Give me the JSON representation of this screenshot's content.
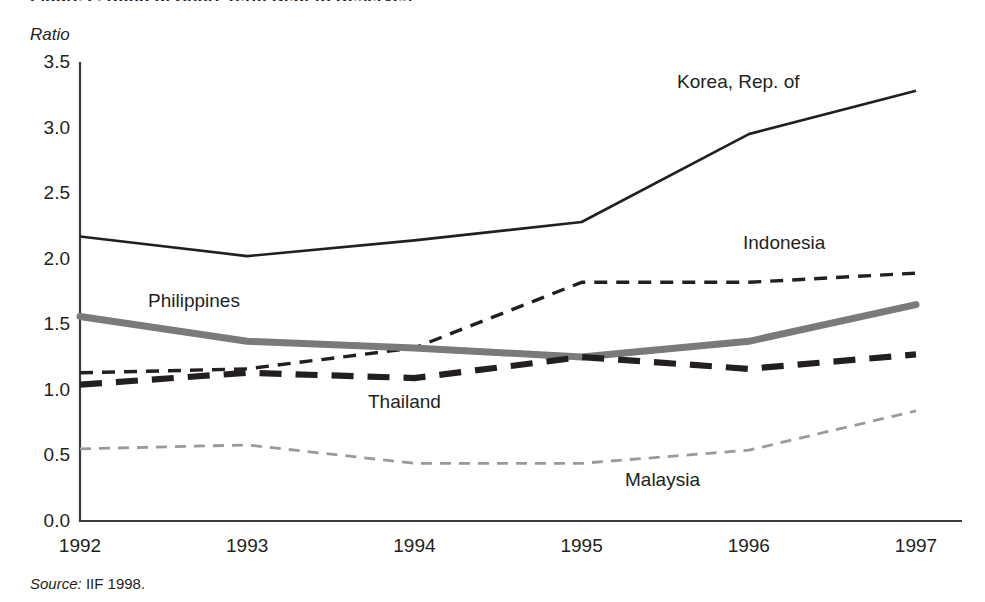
{
  "figure": {
    "title": "Figure 2. Ratio of Short-Term Debt to Reserves",
    "axis_unit_label": "Ratio",
    "source_prefix": "Source:",
    "source_text": "IIF 1998."
  },
  "chart_data": {
    "type": "line",
    "title": "Figure 2. Ratio of Short-Term Debt to Reserves",
    "xlabel": "",
    "ylabel": "Ratio",
    "x": [
      "1992",
      "1993",
      "1994",
      "1995",
      "1996",
      "1997"
    ],
    "xlim": [
      1992,
      1997
    ],
    "ylim": [
      0.0,
      3.5
    ],
    "yticks": [
      "0.0",
      "0.5",
      "1.0",
      "1.5",
      "2.0",
      "2.5",
      "3.0",
      "3.5"
    ],
    "ytick_values": [
      0.0,
      0.5,
      1.0,
      1.5,
      2.0,
      2.5,
      3.0,
      3.5
    ],
    "grid": false,
    "legend": "inline-labels",
    "series": [
      {
        "name": "Korea, Rep. of",
        "style": "solid-thin-black",
        "color": "#231f20",
        "values": [
          2.17,
          2.02,
          2.14,
          2.28,
          2.95,
          3.28
        ]
      },
      {
        "name": "Indonesia",
        "style": "dashed-medium-black",
        "color": "#231f20",
        "values": [
          1.13,
          1.16,
          1.32,
          1.82,
          1.82,
          1.89
        ]
      },
      {
        "name": "Philippines",
        "style": "solid-thick-gray",
        "color": "#7a7a7a",
        "values": [
          1.56,
          1.37,
          1.32,
          1.25,
          1.37,
          1.65
        ]
      },
      {
        "name": "Thailand",
        "style": "dashed-thick-black",
        "color": "#231f20",
        "values": [
          1.04,
          1.13,
          1.09,
          1.25,
          1.16,
          1.27
        ]
      },
      {
        "name": "Malaysia",
        "style": "dashed-thin-lightgray",
        "color": "#9a9a9a",
        "values": [
          0.55,
          0.58,
          0.44,
          0.44,
          0.54,
          0.84
        ]
      }
    ],
    "series_label_positions": [
      {
        "name": "Korea, Rep. of",
        "x": 677,
        "y": 72
      },
      {
        "name": "Indonesia",
        "x": 743,
        "y": 233
      },
      {
        "name": "Philippines",
        "x": 148,
        "y": 291
      },
      {
        "name": "Thailand",
        "x": 368,
        "y": 392
      },
      {
        "name": "Malaysia",
        "x": 625,
        "y": 470
      }
    ]
  }
}
